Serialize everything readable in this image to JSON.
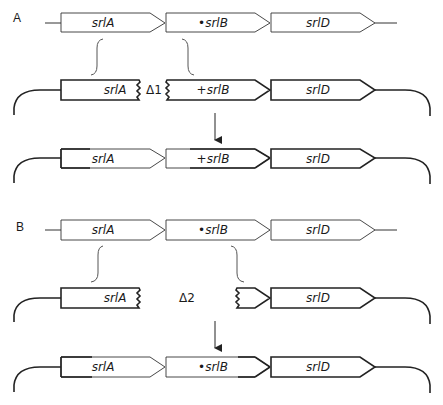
{
  "panels": [
    {
      "label": "A",
      "row1": {
        "genes": [
          "srlA",
          "•srlB",
          "srlD"
        ]
      },
      "row2": {
        "genes": [
          "srlA",
          "+srlB",
          "srlD"
        ],
        "deletion": "Δ1"
      },
      "row3": {
        "genes": [
          "srlA",
          "+srlB",
          "srlD"
        ]
      }
    },
    {
      "label": "B",
      "row1": {
        "genes": [
          "srlA",
          "•srlB",
          "srlD"
        ]
      },
      "row2": {
        "genes": [
          "srlA",
          "srlD"
        ],
        "deletion": "Δ2"
      },
      "row3": {
        "genes": [
          "srlA",
          "•srlB",
          "srlD"
        ]
      }
    }
  ],
  "colors": {
    "stroke": "#222222",
    "background": "#ffffff"
  }
}
